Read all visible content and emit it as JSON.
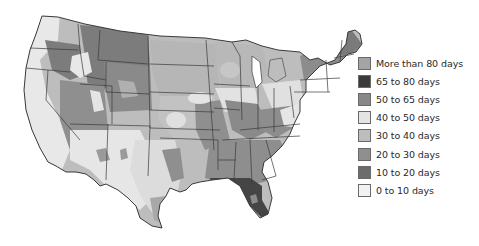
{
  "map": {
    "subject": "Contiguous United States",
    "description": "Choropleth map of number of days per year, shaded by range"
  },
  "legend": {
    "items": [
      {
        "label": "More than 80 days",
        "color": "#a4a4a4"
      },
      {
        "label": "65 to 80 days",
        "color": "#3a3a3a"
      },
      {
        "label": "50 to 65 days",
        "color": "#888888"
      },
      {
        "label": "40 to 50 days",
        "color": "#e4e4e4"
      },
      {
        "label": "30 to 40 days",
        "color": "#bdbdbd"
      },
      {
        "label": "20 to 30 days",
        "color": "#8f8f8f"
      },
      {
        "label": "10 to 20 days",
        "color": "#6c6c6c"
      },
      {
        "label": "0 to 10 days",
        "color": "#f2f2f2"
      }
    ]
  },
  "colors": {
    "state_border": "#3a3a3a",
    "background": "#ffffff"
  }
}
